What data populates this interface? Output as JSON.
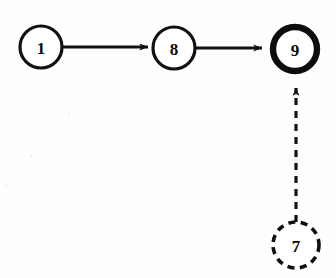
{
  "diagram": {
    "background_color": "#fefefe",
    "stroke_color": "#111111",
    "nodes": [
      {
        "id": "n1",
        "label": "1",
        "cx": 41,
        "cy": 47,
        "r": 21,
        "style": "solid",
        "name": "node-1"
      },
      {
        "id": "n8",
        "label": "8",
        "cx": 174,
        "cy": 48,
        "r": 21,
        "style": "solid",
        "name": "node-8"
      },
      {
        "id": "n9",
        "label": "9",
        "cx": 295,
        "cy": 49,
        "r": 22,
        "style": "bold",
        "name": "node-9"
      },
      {
        "id": "n7",
        "label": "7",
        "cx": 296,
        "cy": 245,
        "r": 23,
        "style": "dashed",
        "name": "node-7"
      }
    ],
    "edges": [
      {
        "id": "e1",
        "from": "1",
        "to": "8",
        "style": "solid",
        "direction": "right",
        "name": "edge-1-to-8"
      },
      {
        "id": "e2",
        "from": "8",
        "to": "9",
        "style": "solid",
        "direction": "right",
        "name": "edge-8-to-9"
      },
      {
        "id": "e3",
        "from": "7",
        "to": "9",
        "style": "dashed",
        "direction": "up",
        "name": "edge-7-to-9"
      }
    ]
  }
}
